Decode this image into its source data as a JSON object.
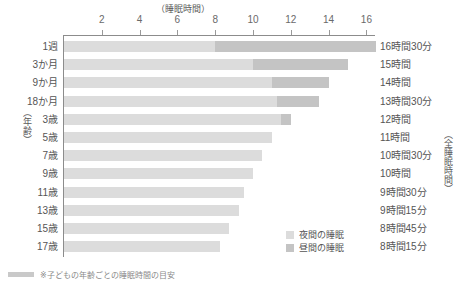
{
  "chart_data": {
    "type": "bar",
    "title": "（睡眠時間）",
    "xlabel": "（睡眠時間）",
    "ylabel": "（年齢）",
    "right_axis_label": "（全睡眠時間）",
    "xlim": [
      0,
      16.5
    ],
    "grid": false,
    "legend_position": "bottom-right",
    "orientation": "horizontal",
    "stacked": true,
    "xticks": [
      "2",
      "4",
      "6",
      "8",
      "10",
      "12",
      "14",
      "16"
    ],
    "xtick_values": [
      2,
      4,
      6,
      8,
      10,
      12,
      14,
      16
    ],
    "categories": [
      "1週",
      "3か月",
      "9か月",
      "18か月",
      "3歳",
      "5歳",
      "7歳",
      "9歳",
      "11歳",
      "13歳",
      "15歳",
      "17歳"
    ],
    "series": [
      {
        "name": "夜間の睡眠",
        "color": "#dcdcdc",
        "values": [
          8.0,
          10.0,
          11.0,
          11.25,
          11.5,
          11.0,
          10.5,
          10.0,
          9.5,
          9.25,
          8.75,
          8.25
        ]
      },
      {
        "name": "昼間の睡眠",
        "color": "#c4c4c4",
        "values": [
          8.5,
          5.0,
          3.0,
          2.25,
          0.5,
          0,
          0,
          0,
          0,
          0,
          0,
          0
        ]
      }
    ],
    "totals": [
      16.5,
      15.0,
      14.0,
      13.5,
      12.0,
      11.0,
      10.5,
      10.0,
      9.5,
      9.25,
      8.75,
      8.25
    ],
    "total_labels": [
      "16時間30分",
      "15時間",
      "14時間",
      "13時間30分",
      "12時間",
      "11時間",
      "10時間30分",
      "10時間",
      "9時間30分",
      "9時間15分",
      "8時間45分",
      "8時間15分"
    ],
    "legend": [
      "夜間の睡眠",
      "昼間の睡眠"
    ]
  },
  "footer": {
    "note": "※子どもの年齢ごとの睡眠時間の目安"
  }
}
